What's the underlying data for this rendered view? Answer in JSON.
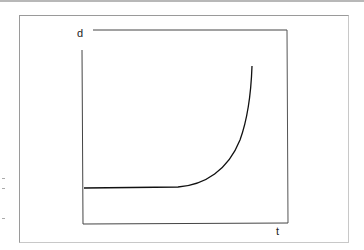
{
  "figure": {
    "y_axis_label": "d",
    "x_axis_label": "t"
  },
  "colors": {
    "axis": "#444444",
    "curve": "#111111",
    "frame": "#9a9a9a"
  },
  "curve": {
    "type": "flat-then-exponential",
    "points_px": [
      [
        84,
        188
      ],
      [
        178,
        187
      ],
      [
        200,
        183
      ],
      [
        215,
        175
      ],
      [
        228,
        162
      ],
      [
        238,
        145
      ],
      [
        245,
        125
      ],
      [
        249,
        100
      ],
      [
        252,
        66
      ]
    ]
  }
}
